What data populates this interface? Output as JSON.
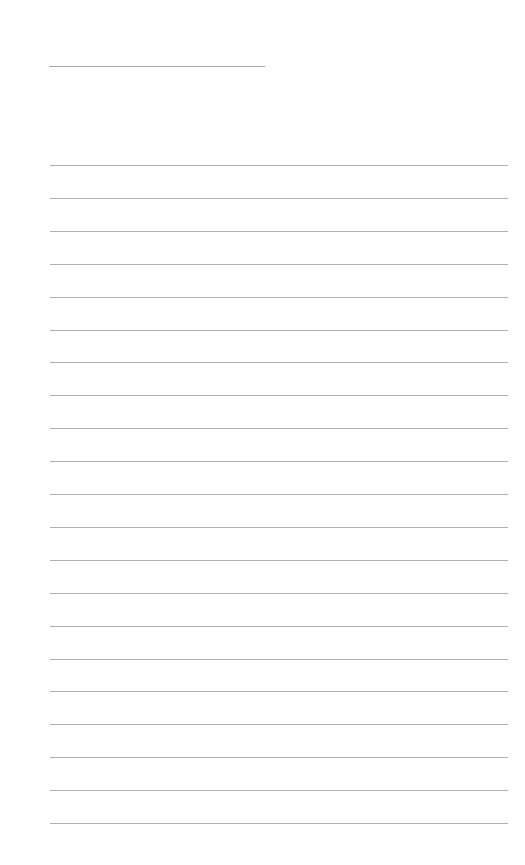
{
  "page": {
    "type": "lined-paper",
    "background_color": "#ffffff",
    "line_color": "#b0b0b0",
    "title_line": {
      "x": 49,
      "y": 66,
      "width": 216
    },
    "ruled_lines": {
      "count": 21,
      "first_y": 165,
      "spacing": 32.9,
      "x": 50,
      "width": 458
    }
  }
}
